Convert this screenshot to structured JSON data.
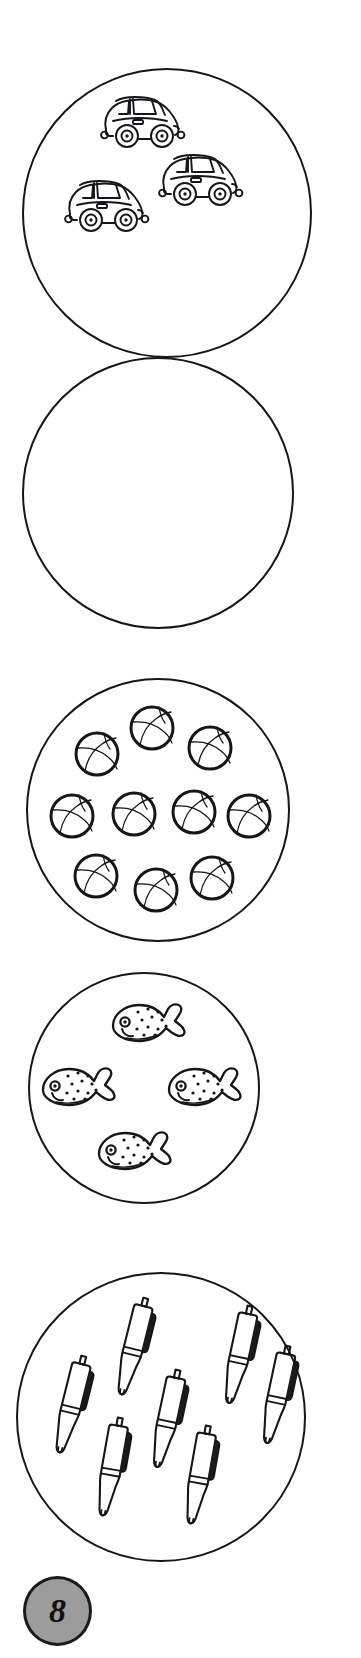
{
  "worksheet": {
    "title": "Count the objects worksheet",
    "page_number": "8",
    "background_color": "#ffffff",
    "outline_color": "#16161a",
    "badge_fill_color": "#9c9c9c"
  },
  "groups": [
    {
      "id": "group-cars",
      "item_name": "car",
      "count": 3,
      "count_label": "3",
      "circle": {
        "left": 22,
        "top": 68,
        "size": 290
      },
      "items": [
        {
          "x": 72,
          "y": 22,
          "rotate": 0
        },
        {
          "x": 36,
          "y": 106,
          "rotate": 0
        },
        {
          "x": 130,
          "y": 80,
          "rotate": 0
        }
      ]
    },
    {
      "id": "group-empty",
      "item_name": "none",
      "count": 0,
      "count_label": "0",
      "circle": {
        "left": 22,
        "top": 357,
        "size": 272
      },
      "items": []
    },
    {
      "id": "group-balls",
      "item_name": "ball",
      "count": 10,
      "count_label": "10",
      "circle": {
        "left": 26,
        "top": 678,
        "size": 264
      },
      "items": [
        {
          "x": 100,
          "y": 24,
          "rotate": 0
        },
        {
          "x": 45,
          "y": 50,
          "rotate": 0
        },
        {
          "x": 158,
          "y": 44,
          "rotate": 0
        },
        {
          "x": 20,
          "y": 112,
          "rotate": 0
        },
        {
          "x": 82,
          "y": 110,
          "rotate": 0
        },
        {
          "x": 142,
          "y": 108,
          "rotate": 0
        },
        {
          "x": 197,
          "y": 112,
          "rotate": 0
        },
        {
          "x": 44,
          "y": 172,
          "rotate": 0
        },
        {
          "x": 104,
          "y": 186,
          "rotate": 0
        },
        {
          "x": 160,
          "y": 174,
          "rotate": 0
        }
      ]
    },
    {
      "id": "group-fish",
      "item_name": "fish",
      "count": 4,
      "count_label": "4",
      "circle": {
        "left": 28,
        "top": 972,
        "size": 232
      },
      "items": [
        {
          "x": 78,
          "y": 24,
          "rotate": 0
        },
        {
          "x": 8,
          "y": 88,
          "rotate": 0
        },
        {
          "x": 134,
          "y": 88,
          "rotate": 0
        },
        {
          "x": 64,
          "y": 152,
          "rotate": 0
        }
      ]
    },
    {
      "id": "group-pens",
      "item_name": "pen",
      "count": 7,
      "count_label": "7",
      "circle": {
        "left": 16,
        "top": 1272,
        "size": 290
      },
      "items": [
        {
          "x": 38,
          "y": 78,
          "rotate": 14
        },
        {
          "x": 100,
          "y": 20,
          "rotate": 14
        },
        {
          "x": 78,
          "y": 140,
          "rotate": 10
        },
        {
          "x": 134,
          "y": 92,
          "rotate": 12
        },
        {
          "x": 166,
          "y": 148,
          "rotate": 10
        },
        {
          "x": 206,
          "y": 28,
          "rotate": 12
        },
        {
          "x": 244,
          "y": 68,
          "rotate": 12
        }
      ]
    }
  ],
  "icons": {
    "car": "car-icon",
    "ball": "basketball-icon",
    "fish": "fish-icon",
    "pen": "pen-icon",
    "badge": "page-number-badge"
  }
}
